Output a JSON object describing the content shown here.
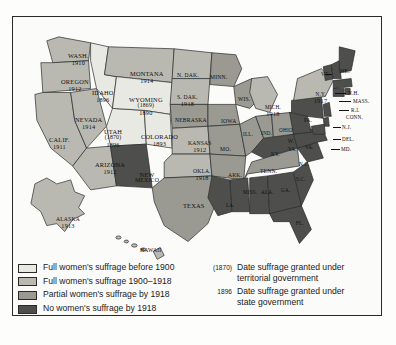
{
  "figure": {
    "kind": "thematic-map"
  },
  "colors": {
    "tier_full_before_1900": "#e9e9e4",
    "tier_full_1900_1918": "#b9b9b2",
    "tier_partial_by_1918": "#9a9a93",
    "tier_none_by_1918": "#4e4e4c",
    "outline": "#2a2a2a",
    "water": "#ffffff",
    "label": "#111111",
    "frame": "#2a2a2a"
  },
  "legend": {
    "swatches": [
      {
        "key": "tier_full_before_1900",
        "label": "Full women's suffrage before 1900"
      },
      {
        "key": "tier_full_1900_1918",
        "label": "Full women's suffrage 1900–1918"
      },
      {
        "key": "tier_partial_by_1918",
        "label": "Partial women's suffrage by 1918"
      },
      {
        "key": "tier_none_by_1918",
        "label": "No women's suffrage by 1918"
      }
    ],
    "notes": [
      {
        "date": "(1870)",
        "line1": "Date suffrage granted under",
        "line2": "territorial government"
      },
      {
        "date": "1896",
        "line1": "Date suffrage granted under",
        "line2": "state government"
      }
    ]
  },
  "states": [
    {
      "name": "WASH.",
      "date": "1910",
      "tier": "tier_full_1900_1918"
    },
    {
      "name": "OREGON",
      "date": "1912",
      "tier": "tier_full_1900_1918"
    },
    {
      "name": "CALIF.",
      "date": "1911",
      "tier": "tier_full_1900_1918"
    },
    {
      "name": "NEVADA",
      "date": "1914",
      "tier": "tier_full_1900_1918"
    },
    {
      "name": "IDAHO",
      "date": "1896",
      "tier": "tier_full_before_1900"
    },
    {
      "name": "UTAH",
      "territorial": "(1870)",
      "date": "1896",
      "tier": "tier_full_before_1900"
    },
    {
      "name": "ARIZONA",
      "date": "1912",
      "tier": "tier_full_1900_1918"
    },
    {
      "name": "MONTANA",
      "date": "1914",
      "tier": "tier_full_1900_1918"
    },
    {
      "name": "WYOMING",
      "territorial": "(1869)",
      "date": "1890",
      "tier": "tier_full_before_1900"
    },
    {
      "name": "COLORADO",
      "date": "1893",
      "tier": "tier_full_before_1900"
    },
    {
      "name": "NEW MEXICO",
      "date": "",
      "tier": "tier_none_by_1918"
    },
    {
      "name": "N. DAK.",
      "date": "",
      "tier": "tier_full_1900_1918"
    },
    {
      "name": "S. DAK.",
      "date": "1918",
      "tier": "tier_full_1900_1918"
    },
    {
      "name": "NEBRASKA",
      "date": "",
      "tier": "tier_partial_by_1918"
    },
    {
      "name": "KANSAS",
      "date": "1912",
      "tier": "tier_full_1900_1918"
    },
    {
      "name": "OKLA.",
      "date": "1918",
      "tier": "tier_full_1900_1918"
    },
    {
      "name": "TEXAS",
      "date": "",
      "tier": "tier_partial_by_1918"
    },
    {
      "name": "MINN.",
      "date": "",
      "tier": "tier_partial_by_1918"
    },
    {
      "name": "IOWA",
      "date": "",
      "tier": "tier_partial_by_1918"
    },
    {
      "name": "MO.",
      "date": "",
      "tier": "tier_partial_by_1918"
    },
    {
      "name": "ARK.",
      "date": "",
      "tier": "tier_partial_by_1918"
    },
    {
      "name": "WIS.",
      "date": "",
      "tier": "tier_partial_by_1918"
    },
    {
      "name": "ILL.",
      "date": "",
      "tier": "tier_partial_by_1918"
    },
    {
      "name": "IND.",
      "date": "",
      "tier": "tier_partial_by_1918"
    },
    {
      "name": "MICH.",
      "date": "1918",
      "tier": "tier_full_1900_1918"
    },
    {
      "name": "OHIO",
      "date": "",
      "tier": "tier_partial_by_1918"
    },
    {
      "name": "N.Y.",
      "date": "1917",
      "tier": "tier_full_1900_1918"
    },
    {
      "name": "PA.",
      "date": "",
      "tier": "tier_none_by_1918"
    },
    {
      "name": "VT.",
      "date": "",
      "tier": "tier_none_by_1918"
    },
    {
      "name": "ME.",
      "date": "",
      "tier": "tier_none_by_1918"
    },
    {
      "name": "N.H.",
      "date": "",
      "tier": "tier_none_by_1918"
    },
    {
      "name": "MASS.",
      "date": "",
      "tier": "tier_none_by_1918"
    },
    {
      "name": "R.I.",
      "date": "",
      "tier": "tier_none_by_1918"
    },
    {
      "name": "CONN.",
      "date": "",
      "tier": "tier_none_by_1918"
    },
    {
      "name": "N.J.",
      "date": "",
      "tier": "tier_none_by_1918"
    },
    {
      "name": "DEL.",
      "date": "",
      "tier": "tier_none_by_1918"
    },
    {
      "name": "MD.",
      "date": "",
      "tier": "tier_none_by_1918"
    },
    {
      "name": "W. VA.",
      "date": "",
      "tier": "tier_none_by_1918"
    },
    {
      "name": "VA.",
      "date": "",
      "tier": "tier_none_by_1918"
    },
    {
      "name": "KY.",
      "date": "",
      "tier": "tier_none_by_1918"
    },
    {
      "name": "TENN.",
      "date": "",
      "tier": "tier_partial_by_1918"
    },
    {
      "name": "N.C.",
      "date": "",
      "tier": "tier_none_by_1918"
    },
    {
      "name": "S.C.",
      "date": "",
      "tier": "tier_none_by_1918"
    },
    {
      "name": "GA.",
      "date": "",
      "tier": "tier_none_by_1918"
    },
    {
      "name": "ALA.",
      "date": "",
      "tier": "tier_none_by_1918"
    },
    {
      "name": "MISS.",
      "date": "",
      "tier": "tier_none_by_1918"
    },
    {
      "name": "LA.",
      "date": "",
      "tier": "tier_none_by_1918"
    },
    {
      "name": "FL.",
      "date": "",
      "tier": "tier_none_by_1918"
    },
    {
      "name": "ALASKA",
      "date": "1913",
      "tier": "tier_full_1900_1918"
    },
    {
      "name": "HAWAII",
      "date": "",
      "tier": "tier_full_1900_1918"
    }
  ],
  "labels": [
    {
      "id": "wash",
      "name": "WASH.",
      "date": "1910",
      "x": 55,
      "y": 36,
      "cls": ""
    },
    {
      "id": "oregon",
      "name": "OREGON",
      "date": "1912",
      "x": 48,
      "y": 62,
      "cls": ""
    },
    {
      "id": "calif",
      "name": "CALIF.",
      "date": "1911",
      "x": 36,
      "y": 120,
      "cls": ""
    },
    {
      "id": "nevada",
      "name": "NEVADA",
      "date": "1914",
      "x": 62,
      "y": 100,
      "cls": ""
    },
    {
      "id": "idaho",
      "name": "IDAHO",
      "date": "1896",
      "x": 79,
      "y": 73,
      "cls": ""
    },
    {
      "id": "arizona",
      "name": "ARIZONA",
      "date": "1912",
      "x": 82,
      "y": 145,
      "cls": ""
    },
    {
      "id": "montana",
      "name": "MONTANA",
      "date": "1914",
      "x": 117,
      "y": 54,
      "cls": ""
    },
    {
      "id": "colorado",
      "name": "COLORADO",
      "date": "1893",
      "x": 128,
      "y": 117,
      "cls": ""
    },
    {
      "id": "ndak",
      "name": "N. DAK.",
      "date": "",
      "x": 164,
      "y": 56,
      "cls": "sm"
    },
    {
      "id": "sdak",
      "name": "S. DAK.",
      "date": "1918",
      "x": 164,
      "y": 78,
      "cls": "sm"
    },
    {
      "id": "nebraska",
      "name": "NEBRASKA",
      "date": "",
      "x": 162,
      "y": 101,
      "cls": "sm"
    },
    {
      "id": "kansas",
      "name": "KANSAS",
      "date": "1912",
      "x": 175,
      "y": 124,
      "cls": "sm"
    },
    {
      "id": "okla",
      "name": "OKLA.",
      "date": "1918",
      "x": 180,
      "y": 152,
      "cls": "sm"
    },
    {
      "id": "texas",
      "name": "TEXAS",
      "date": "",
      "x": 170,
      "y": 186,
      "cls": ""
    },
    {
      "id": "minn",
      "name": "MINN.",
      "date": "",
      "x": 197,
      "y": 58,
      "cls": "sm"
    },
    {
      "id": "iowa",
      "name": "IOWA",
      "date": "",
      "x": 208,
      "y": 102,
      "cls": "sm"
    },
    {
      "id": "wis",
      "name": "WIS.",
      "date": "",
      "x": 225,
      "y": 80,
      "cls": "sm"
    },
    {
      "id": "mo",
      "name": "MO.",
      "date": "",
      "x": 207,
      "y": 130,
      "cls": "sm"
    },
    {
      "id": "ark",
      "name": "ARK.",
      "date": "",
      "x": 215,
      "y": 156,
      "cls": "sm"
    },
    {
      "id": "ill",
      "name": "ILL.",
      "date": "",
      "x": 230,
      "y": 115,
      "cls": "tiny"
    },
    {
      "id": "ind",
      "name": "IND.",
      "date": "",
      "x": 248,
      "y": 114,
      "cls": "tiny"
    },
    {
      "id": "mich",
      "name": "MICH.",
      "date": "1918",
      "x": 252,
      "y": 88,
      "cls": "tiny"
    },
    {
      "id": "ohio",
      "name": "OHIO",
      "date": "",
      "x": 266,
      "y": 111,
      "cls": "tiny"
    },
    {
      "id": "ky",
      "name": "KY.",
      "date": "",
      "x": 258,
      "y": 135,
      "cls": "tiny"
    },
    {
      "id": "tenn",
      "name": "TENN.",
      "date": "",
      "x": 247,
      "y": 152,
      "cls": "sm"
    },
    {
      "id": "miss",
      "name": "MISS.",
      "date": "",
      "x": 230,
      "y": 173,
      "cls": "tiny"
    },
    {
      "id": "ala",
      "name": "ALA.",
      "date": "",
      "x": 248,
      "y": 173,
      "cls": "tiny"
    },
    {
      "id": "ga",
      "name": "GA.",
      "date": "",
      "x": 268,
      "y": 171,
      "cls": "tiny"
    },
    {
      "id": "la",
      "name": "LA.",
      "date": "",
      "x": 213,
      "y": 186,
      "cls": "tiny"
    },
    {
      "id": "fl",
      "name": "FL.",
      "date": "",
      "x": 283,
      "y": 204,
      "cls": "tiny"
    },
    {
      "id": "sc",
      "name": "S.C.",
      "date": "",
      "x": 283,
      "y": 160,
      "cls": "tiny"
    },
    {
      "id": "nc",
      "name": "N.C.",
      "date": "",
      "x": 286,
      "y": 145,
      "cls": "tiny"
    },
    {
      "id": "va",
      "name": "VA.",
      "date": "",
      "x": 292,
      "y": 128,
      "cls": "tiny"
    },
    {
      "id": "wva",
      "name": "W.",
      "date": "",
      "x": 275,
      "y": 122,
      "cls": "tiny"
    },
    {
      "id": "wva2",
      "name": "VA.",
      "date": "",
      "x": 275,
      "y": 130,
      "cls": "tiny"
    },
    {
      "id": "pa",
      "name": "PA.",
      "date": "",
      "x": 291,
      "y": 101,
      "cls": "tiny"
    },
    {
      "id": "ny",
      "name": "N.Y.",
      "date": "1917",
      "x": 301,
      "y": 75,
      "cls": "tiny"
    },
    {
      "id": "vt",
      "name": "VT.",
      "date": "",
      "x": 308,
      "y": 55,
      "cls": "tiny"
    },
    {
      "id": "me",
      "name": "ME.",
      "date": "",
      "x": 327,
      "y": 52,
      "cls": "tiny"
    },
    {
      "id": "nh",
      "name": "N.H.",
      "date": "",
      "x": 335,
      "y": 74,
      "cls": "tiny"
    },
    {
      "id": "mass",
      "name": "MASS.",
      "date": "",
      "x": 340,
      "y": 82,
      "cls": "tiny"
    },
    {
      "id": "ri",
      "name": "R.I.",
      "date": "",
      "x": 338,
      "y": 91,
      "cls": "tiny"
    },
    {
      "id": "conn",
      "name": "CONN.",
      "date": "",
      "x": 333,
      "y": 98,
      "cls": "tiny"
    },
    {
      "id": "nj",
      "name": "N.J.",
      "date": "",
      "x": 329,
      "y": 108,
      "cls": "tiny"
    },
    {
      "id": "del",
      "name": "DEL.",
      "date": "",
      "x": 329,
      "y": 120,
      "cls": "tiny"
    },
    {
      "id": "md",
      "name": "MD.",
      "date": "",
      "x": 328,
      "y": 130,
      "cls": "tiny"
    },
    {
      "id": "alaska",
      "name": "ALASKA",
      "date": "1913",
      "x": 43,
      "y": 200,
      "cls": "sm"
    },
    {
      "id": "hawaii",
      "name": "HAWAII",
      "date": "",
      "x": 127,
      "y": 231,
      "cls": "sm"
    }
  ],
  "multiline_labels": [
    {
      "id": "utah",
      "name": "UTAH",
      "territorial": "(1870)",
      "date": "1896",
      "x": 91,
      "y": 112
    },
    {
      "id": "wyoming",
      "name": "WYOMING",
      "territorial": "(1869)",
      "date": "1890",
      "x": 116,
      "y": 80
    },
    {
      "id": "newmex",
      "name": "NEW",
      "territorial": "MEXICO",
      "date": "",
      "x": 122,
      "y": 155
    }
  ]
}
